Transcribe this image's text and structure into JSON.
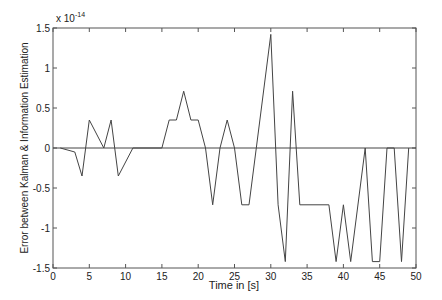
{
  "chart_data": {
    "type": "line",
    "title": "",
    "xlabel": "Time in [s]",
    "ylabel": "Error between Kalman & Information Estimation",
    "y_multiplier": "x 10^-14",
    "xlim": [
      0,
      50
    ],
    "ylim": [
      -1.5,
      1.5
    ],
    "grid": false,
    "x_ticks": [
      0,
      5,
      10,
      15,
      20,
      25,
      30,
      35,
      40,
      45,
      50
    ],
    "y_ticks": [
      -1.5,
      -1,
      -0.5,
      0,
      0.5,
      1,
      1.5
    ],
    "series": [
      {
        "name": "error",
        "color": "#444444",
        "x": [
          1,
          3,
          4,
          5,
          7,
          8,
          9,
          11,
          15,
          16,
          17,
          18,
          19,
          20,
          21,
          22,
          23,
          24,
          25,
          26,
          27,
          28,
          30,
          31,
          32,
          33,
          34,
          38,
          39,
          40,
          41,
          43,
          44,
          45,
          46,
          47,
          48,
          49
        ],
        "values": [
          0,
          -0.05,
          -0.35,
          0.35,
          0,
          0.35,
          -0.35,
          0,
          0,
          0.35,
          0.35,
          0.71,
          0.35,
          0.35,
          0,
          -0.71,
          0,
          0.35,
          0,
          -0.71,
          -0.71,
          0,
          1.42,
          -0.71,
          -1.42,
          0.71,
          -0.71,
          -0.71,
          -1.42,
          -0.71,
          -1.42,
          0,
          -1.42,
          -1.42,
          0,
          0,
          -1.42,
          0
        ]
      }
    ],
    "reference_line": {
      "y": 0,
      "color": "#444444"
    }
  }
}
